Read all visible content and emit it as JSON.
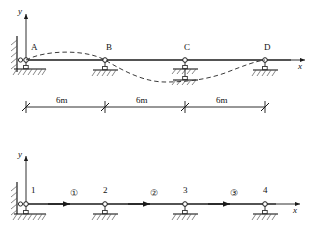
{
  "figure": {
    "title_semantic": "continuous-beam-and-finite-element-model",
    "line_color": "#1a1a1a",
    "dashed_color": "#3a3a3a",
    "hatch_color": "#555555"
  },
  "top_diagram": {
    "name": "continuous-beam-with-deflected-shape",
    "axes": {
      "y_label": "y",
      "x_label": "x"
    },
    "supports": [
      {
        "label": "A",
        "type": "pinned-wall-and-roller",
        "x_m": 0
      },
      {
        "label": "B",
        "type": "roller-on-ground",
        "x_m": 6
      },
      {
        "label": "C",
        "type": "double-stacked-roller",
        "x_m": 12
      },
      {
        "label": "D",
        "type": "roller-on-ground",
        "x_m": 18
      }
    ],
    "deflection_curve": "dashed deflected shape: hogs upward in span A-B, sags downward through B-C, returns upward to D",
    "dimensions": [
      {
        "label": "6m",
        "from": "A",
        "to": "B"
      },
      {
        "label": "6m",
        "from": "B",
        "to": "C"
      },
      {
        "label": "6m",
        "from": "C",
        "to": "D"
      }
    ]
  },
  "bottom_diagram": {
    "name": "finite-element-discretization",
    "axes": {
      "y_label": "y",
      "x_label": "x"
    },
    "nodes": [
      {
        "label": "1",
        "x_m": 0,
        "support": "pinned-wall-and-roller"
      },
      {
        "label": "2",
        "x_m": 6,
        "support": "roller-on-ground"
      },
      {
        "label": "3",
        "x_m": 12,
        "support": "roller-on-ground"
      },
      {
        "label": "4",
        "x_m": 18,
        "support": "roller-on-ground"
      }
    ],
    "elements": [
      {
        "label": "①",
        "number": 1,
        "from_node": "1",
        "to_node": "2"
      },
      {
        "label": "②",
        "number": 2,
        "from_node": "2",
        "to_node": "3"
      },
      {
        "label": "③",
        "number": 3,
        "from_node": "3",
        "to_node": "4"
      }
    ]
  }
}
